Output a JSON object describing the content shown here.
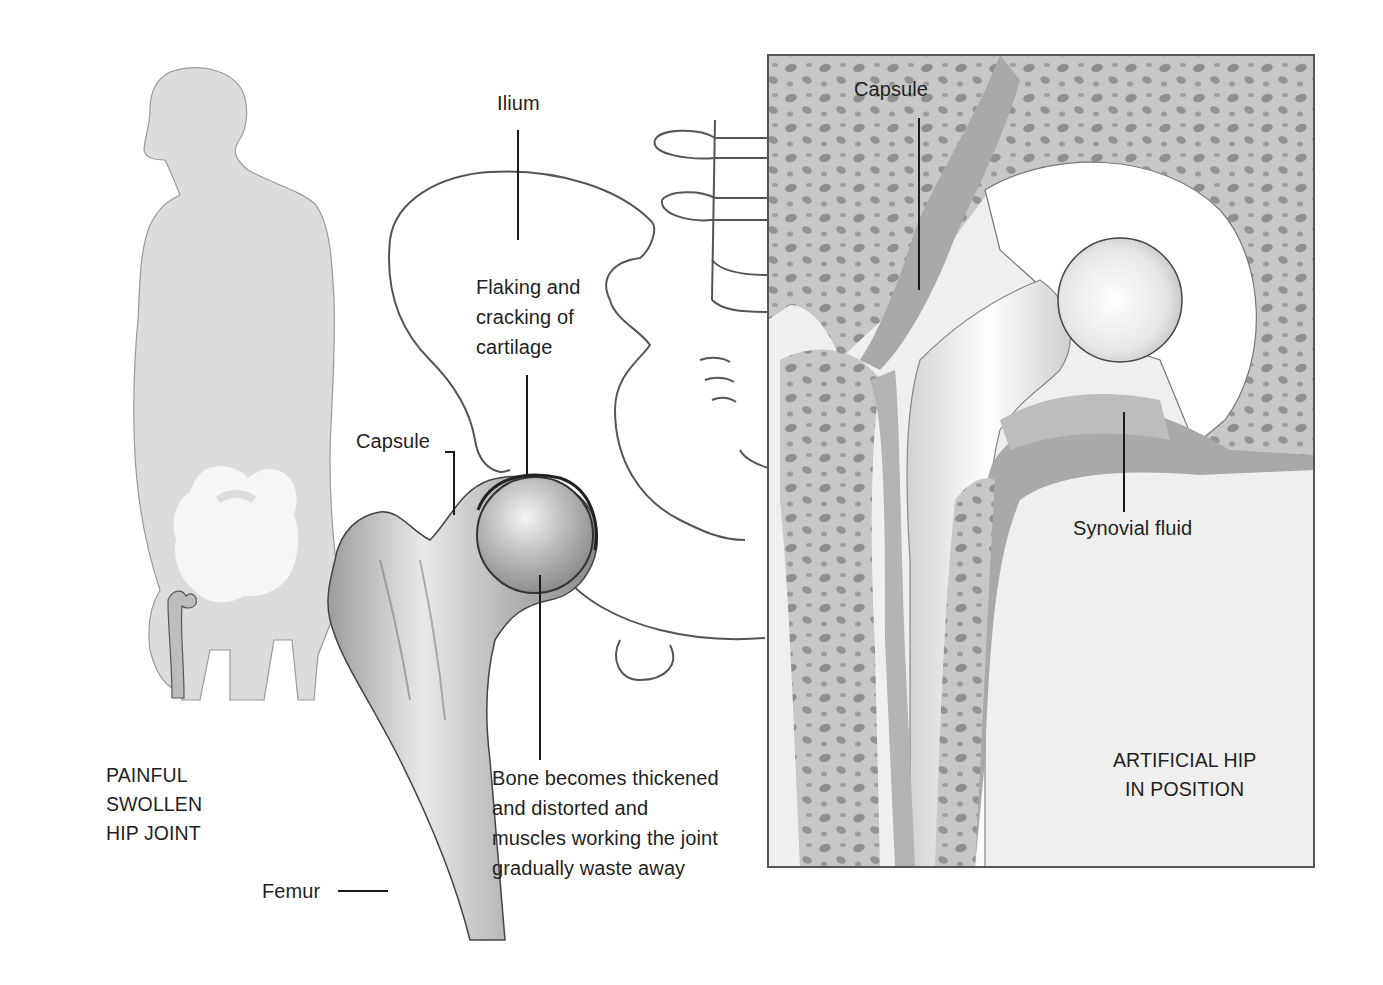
{
  "figure": {
    "panels": {
      "figure_silhouette": {
        "caption_lines": [
          "PAINFUL",
          "SWOLLEN",
          "HIP JOINT"
        ]
      },
      "arthritic_hip": {
        "labels": {
          "ilium": "Ilium",
          "cartilage_lines": [
            "Flaking and",
            "cracking of",
            "cartilage"
          ],
          "capsule": "Capsule",
          "bone_lines": [
            "Bone becomes thickened",
            "and  distorted and",
            "muscles working the joint",
            "gradually waste  away"
          ],
          "femur": "Femur"
        }
      },
      "artificial_hip": {
        "labels": {
          "capsule": "Capsule",
          "synovial_fluid": "Synovial fluid"
        },
        "caption_lines": [
          "ARTIFICIAL HIP",
          "IN POSITION"
        ]
      }
    },
    "colors": {
      "background": "#ffffff",
      "silhouette": "#dcdcdc",
      "bone_fill": "#c9c9c9",
      "capsule_dark": "#a8a8a8",
      "panel_bg": "#efefef",
      "line": "#222222"
    }
  }
}
